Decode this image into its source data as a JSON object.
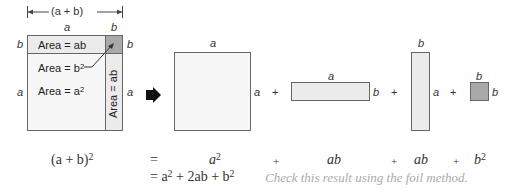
{
  "left_figure": {
    "dimension_label": "(a + b)",
    "top_labels": [
      "a",
      "b"
    ],
    "left_labels": [
      "b",
      "a"
    ],
    "right_labels": [
      "b",
      "a"
    ],
    "areas": {
      "ab_top": "Area = ab",
      "b_squared": "Area = b",
      "b_squared_exp": "2",
      "a_squared": "Area = a",
      "a_squared_exp": "2",
      "ab_side": "Area = ab"
    }
  },
  "decomposition": {
    "a_square": {
      "top": "a",
      "side": "a"
    },
    "ab_horizontal": {
      "top": "a",
      "side": "b"
    },
    "ab_vertical": {
      "top": "b",
      "side": "a"
    },
    "b_square": {
      "top": "b",
      "side": "b"
    },
    "plus": "+"
  },
  "equation": {
    "lhs": "(a + b)",
    "lhs_exp": "2",
    "equals": "=",
    "term1": "a",
    "term1_exp": "2",
    "term2": "ab",
    "term3": "ab",
    "term4": "b",
    "term4_exp": "2",
    "plus": "+",
    "result_prefix": "= a",
    "result_mid": " + 2ab + b",
    "exp": "2",
    "note": "Check this result using the foil method."
  },
  "colors": {
    "light_fill": "#ebebeb",
    "dark_fill": "#a9a9a9",
    "stroke": "#666666",
    "note_text": "#aaaaaa"
  }
}
